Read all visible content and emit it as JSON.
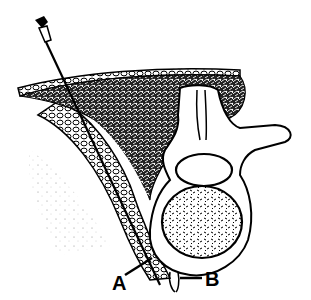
{
  "figure": {
    "labels": [
      {
        "id": "A",
        "text": "A"
      },
      {
        "id": "B",
        "text": "B"
      }
    ],
    "colors": {
      "ink": "#000000",
      "background": "#ffffff"
    }
  }
}
